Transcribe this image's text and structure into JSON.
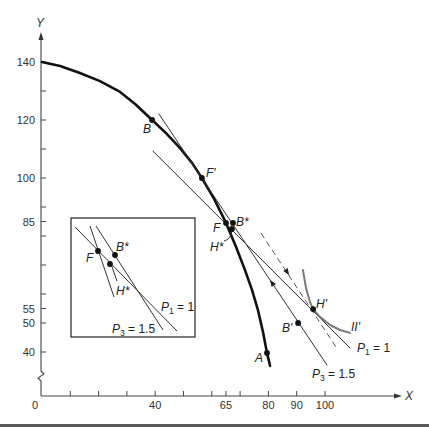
{
  "chart_data": {
    "type": "line",
    "title": "",
    "xlabel": "X",
    "ylabel": "Y",
    "xlim": [
      0,
      110
    ],
    "ylim": [
      35,
      145
    ],
    "y_axis_break": true,
    "grid": false,
    "legend": "none",
    "x_ticks": [
      {
        "value": 0,
        "label": "0"
      },
      {
        "value": 40,
        "label": "40"
      },
      {
        "value": 65,
        "label": "65"
      },
      {
        "value": 80,
        "label": "80"
      },
      {
        "value": 90,
        "label": "90"
      },
      {
        "value": 100,
        "label": "100"
      }
    ],
    "x_minor_ticks": [
      10,
      20,
      30,
      50,
      60,
      70
    ],
    "y_ticks": [
      {
        "value": 140,
        "label": "140"
      },
      {
        "value": 120,
        "label": "120"
      },
      {
        "value": 100,
        "label": "100"
      },
      {
        "value": 85,
        "label": "85"
      },
      {
        "value": 55,
        "label": "55"
      },
      {
        "value": 50,
        "label": "50"
      },
      {
        "value": 40,
        "label": "40"
      }
    ],
    "y_minor_ticks": [
      130,
      110,
      90,
      80,
      70,
      60
    ],
    "series": [
      {
        "name": "production-possibility-curve",
        "style": "thick",
        "color": "#111111",
        "points": [
          [
            0,
            140
          ],
          [
            6.4,
            138.6
          ],
          [
            13.4,
            136.2
          ],
          [
            20.5,
            133.4
          ],
          [
            27.6,
            129.7
          ],
          [
            32.9,
            125.5
          ],
          [
            38.9,
            120
          ],
          [
            43.8,
            115.5
          ],
          [
            48.8,
            110.3
          ],
          [
            53,
            105.2
          ],
          [
            56.5,
            100
          ],
          [
            60.8,
            92.8
          ],
          [
            65,
            84.5
          ],
          [
            68.6,
            76.2
          ],
          [
            71.7,
            68.3
          ],
          [
            74.2,
            61.4
          ],
          [
            76.3,
            54.5
          ],
          [
            78.1,
            46.9
          ],
          [
            79.5,
            39.7
          ],
          [
            80.6,
            35.2
          ]
        ]
      },
      {
        "name": "price-line-p1",
        "label": "P1 = 1",
        "style": "thin",
        "color": "#333333",
        "points": [
          [
            39.2,
            109.3
          ],
          [
            108.8,
            41.4
          ]
        ]
      },
      {
        "name": "price-line-p3",
        "label": "P3 = 1.5",
        "style": "thin",
        "color": "#333333",
        "points": [
          [
            41.3,
            122.1
          ],
          [
            100.7,
            35.5
          ]
        ],
        "arrow": {
          "at": [
            81.3,
            63.8
          ],
          "direction": "backward"
        }
      },
      {
        "name": "dashed-line",
        "style": "dashed",
        "color": "#555555",
        "points": [
          [
            77.4,
            81
          ],
          [
            104.6,
            40.7
          ]
        ],
        "arrow": {
          "at": [
            86.6,
            67.6
          ],
          "direction": "forward"
        }
      },
      {
        "name": "indifference-curve-II-prime",
        "label": "II'",
        "style": "medium",
        "color": "#7a7a7a",
        "points": [
          [
            92.2,
            68.3
          ],
          [
            93.3,
            62.1
          ],
          [
            94.7,
            57.2
          ],
          [
            95.8,
            54.8
          ],
          [
            98.2,
            52.1
          ],
          [
            101.8,
            49.3
          ],
          [
            105.3,
            47.6
          ],
          [
            108.8,
            46.6
          ]
        ]
      }
    ],
    "points": [
      {
        "label": "B",
        "x": 38.9,
        "y": 120
      },
      {
        "label": "F'",
        "x": 56.5,
        "y": 100
      },
      {
        "label": "F",
        "x": 65,
        "y": 84.5
      },
      {
        "label": "B*",
        "x": 67.5,
        "y": 84.5
      },
      {
        "label": "H*",
        "x": 67.1,
        "y": 82.4
      },
      {
        "label": "H'",
        "x": 95.8,
        "y": 54.8
      },
      {
        "label": "B'",
        "x": 90.5,
        "y": 50
      },
      {
        "label": "A",
        "x": 79.5,
        "y": 39.7
      }
    ],
    "annotations": {
      "ii_prime": "II'",
      "p1": {
        "symbol": "P",
        "sub": "1",
        "rest": " = 1"
      },
      "p3": {
        "symbol": "P",
        "sub": "3",
        "rest": " = 1.5"
      }
    },
    "inset": {
      "labels": {
        "F": "F",
        "B_star": "B*",
        "H_star": "H*",
        "p1": {
          "symbol": "P",
          "sub": "1",
          "rest": " = 1"
        },
        "p3": {
          "symbol": "P",
          "sub": "3",
          "rest": " = 1.5"
        }
      }
    }
  }
}
